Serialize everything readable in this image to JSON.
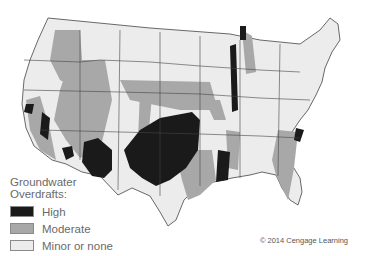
{
  "map": {
    "title": "Groundwater Overdrafts in the United States",
    "colors": {
      "high": "#1a1a1a",
      "moderate": "#a8a8a8",
      "minor_or_none": "#ececec",
      "border": "#444444",
      "background": "#ffffff"
    }
  },
  "legend": {
    "title_line1": "Groundwater",
    "title_line2": "Overdrafts:",
    "items": [
      {
        "label": "High",
        "color": "#1a1a1a"
      },
      {
        "label": "Moderate",
        "color": "#a8a8a8"
      },
      {
        "label": "Minor or none",
        "color": "#ececec"
      }
    ]
  },
  "credit": "© 2014 Cengage Learning"
}
